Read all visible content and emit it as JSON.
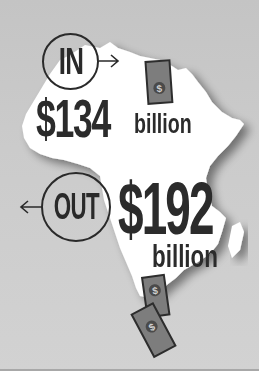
{
  "infographic": {
    "inflow": {
      "label": "IN",
      "amount": "$134",
      "unit": "billion",
      "arrow_direction": "right"
    },
    "outflow": {
      "label": "OUT",
      "amount": "$192",
      "unit": "billion",
      "arrow_direction": "left"
    },
    "map_region": "Africa",
    "icons": [
      "dollar-banknote-icon",
      "dollar-banknote-icon",
      "dollar-banknote-icon"
    ],
    "colors": {
      "background": "#cbcbcb",
      "map_fill": "#ffffff",
      "text": "#2b2b2b",
      "banknote": "#7a7a7a"
    }
  }
}
